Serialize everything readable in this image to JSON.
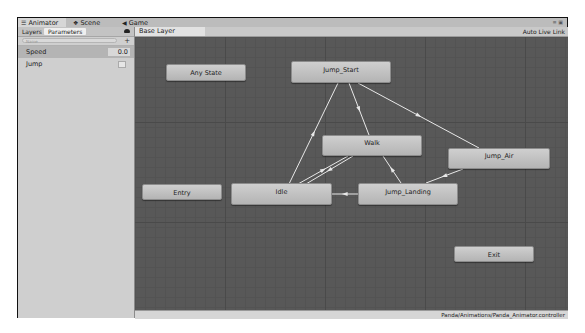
{
  "tabs": [
    {
      "label": "Animator",
      "icon": "animator-icon",
      "active": true
    },
    {
      "label": "Scene",
      "icon": "scene-icon",
      "active": false
    },
    {
      "label": "Game",
      "icon": "game-icon",
      "active": false
    }
  ],
  "left_panel": {
    "layers_label": "Layers",
    "parameters_label": "Parameters",
    "search_placeholder": "Name",
    "add_label": "+",
    "parameters": [
      {
        "name": "Speed",
        "type": "float",
        "value": "0.0"
      },
      {
        "name": "Jump",
        "type": "bool",
        "value": false
      }
    ]
  },
  "graph": {
    "breadcrumb": "Base Layer",
    "auto_live_link": "Auto Live Link",
    "states": [
      {
        "id": "any",
        "label": "Any State"
      },
      {
        "id": "jump_start",
        "label": "Jump_Start"
      },
      {
        "id": "walk",
        "label": "Walk"
      },
      {
        "id": "jump_air",
        "label": "Jump_Air"
      },
      {
        "id": "entry",
        "label": "Entry"
      },
      {
        "id": "idle",
        "label": "Idle"
      },
      {
        "id": "jump_landing",
        "label": "Jump_Landing"
      },
      {
        "id": "exit",
        "label": "Exit"
      }
    ],
    "transitions": [
      {
        "from": "idle",
        "to": "jump_start"
      },
      {
        "from": "jump_start",
        "to": "walk"
      },
      {
        "from": "jump_start",
        "to": "jump_air"
      },
      {
        "from": "idle",
        "to": "walk"
      },
      {
        "from": "walk",
        "to": "idle"
      },
      {
        "from": "jump_landing",
        "to": "walk"
      },
      {
        "from": "jump_air",
        "to": "jump_landing"
      },
      {
        "from": "jump_landing",
        "to": "idle"
      }
    ]
  },
  "status": {
    "asset_path": "Panda/Animations/Panda_Animator.controller"
  },
  "colors": {
    "graph_bg": "#585858",
    "node_fill": "#c4c4c4",
    "edge": "#e8e8e8"
  }
}
